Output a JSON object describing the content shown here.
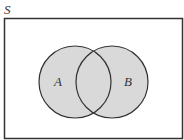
{
  "diagram": {
    "type": "venn",
    "universe_label": "S",
    "sets": [
      {
        "label": "A",
        "fill": "#d9d9d9"
      },
      {
        "label": "B",
        "fill": "#d9d9d9"
      }
    ],
    "border_color": "#333333",
    "background": "#ffffff"
  }
}
